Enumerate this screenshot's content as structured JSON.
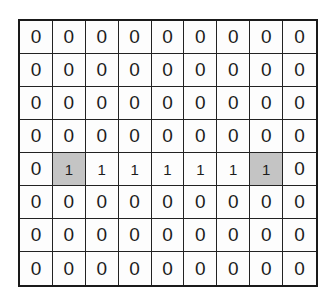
{
  "grid": {
    "rows": 8,
    "cols": 9,
    "highlight_color": "#c4c4c4",
    "values": [
      [
        0,
        0,
        0,
        0,
        0,
        0,
        0,
        0,
        0
      ],
      [
        0,
        0,
        0,
        0,
        0,
        0,
        0,
        0,
        0
      ],
      [
        0,
        0,
        0,
        0,
        0,
        0,
        0,
        0,
        0
      ],
      [
        0,
        0,
        0,
        0,
        0,
        0,
        0,
        0,
        0
      ],
      [
        0,
        1,
        1,
        1,
        1,
        1,
        1,
        1,
        0
      ],
      [
        0,
        0,
        0,
        0,
        0,
        0,
        0,
        0,
        0
      ],
      [
        0,
        0,
        0,
        0,
        0,
        0,
        0,
        0,
        0
      ],
      [
        0,
        0,
        0,
        0,
        0,
        0,
        0,
        0,
        0
      ]
    ],
    "highlighted_cells": [
      [
        4,
        1
      ],
      [
        4,
        7
      ]
    ]
  }
}
